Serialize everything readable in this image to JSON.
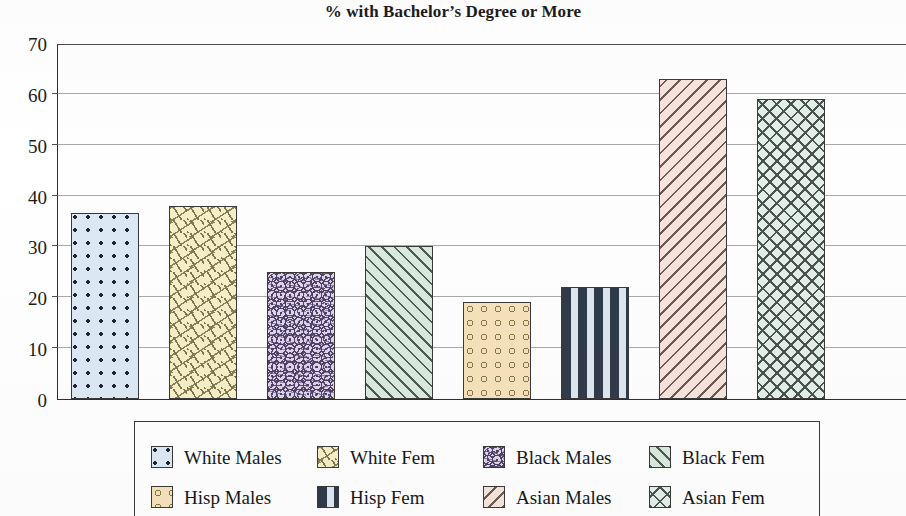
{
  "chart_data": {
    "type": "bar",
    "title": "% with Bachelor’s Degree or More",
    "xlabel": "",
    "ylabel": "",
    "ylim": [
      0,
      70
    ],
    "yticks": [
      0,
      10,
      20,
      30,
      40,
      50,
      60,
      70
    ],
    "grid": true,
    "legend_position": "bottom",
    "categories": [
      "White Males",
      "White Fem",
      "Black Males",
      "Black Fem",
      "Hisp Males",
      "Hisp Fem",
      "Asian Males",
      "Asian Fem"
    ],
    "values": [
      36.5,
      38,
      25,
      30,
      19,
      22,
      63,
      59
    ],
    "bars": [
      {
        "label": "White Males",
        "value": 36.5,
        "fill": "#dce9f4",
        "pattern": "dots",
        "edge": "#3a3a3a"
      },
      {
        "label": "White Fem",
        "value": 38,
        "fill": "#f6eec7",
        "pattern": "scatter",
        "edge": "#3a3a3a"
      },
      {
        "label": "Black Males",
        "value": 25,
        "fill": "#ded4ea",
        "pattern": "squiggle",
        "edge": "#3a3a3a"
      },
      {
        "label": "Black Fem",
        "value": 30,
        "fill": "#d9e9dd",
        "pattern": "diag-r",
        "edge": "#3a3a3a"
      },
      {
        "label": "Hisp Males",
        "value": 19,
        "fill": "#f5e2bc",
        "pattern": "circles",
        "edge": "#3a3a3a"
      },
      {
        "label": "Hisp Fem",
        "value": 22,
        "fill": "#dde5ef",
        "pattern": "hdash",
        "edge": "#3a3a3a"
      },
      {
        "label": "Asian Males",
        "value": 63,
        "fill": "#f7e3dc",
        "pattern": "diag-l",
        "edge": "#3a3a3a"
      },
      {
        "label": "Asian Fem",
        "value": 59,
        "fill": "#e2eee8",
        "pattern": "cross",
        "edge": "#3a3a3a"
      }
    ],
    "legend": [
      {
        "label": "White Males",
        "pattern": "dots"
      },
      {
        "label": "White Fem",
        "pattern": "scatter"
      },
      {
        "label": "Black Males",
        "pattern": "squiggle"
      },
      {
        "label": "Black Fem",
        "pattern": "diag-r"
      },
      {
        "label": "Hisp Males",
        "pattern": "circles"
      },
      {
        "label": "Hisp Fem",
        "pattern": "hdash"
      },
      {
        "label": "Asian Males",
        "pattern": "diag-l"
      },
      {
        "label": "Asian Fem",
        "pattern": "cross"
      }
    ]
  }
}
